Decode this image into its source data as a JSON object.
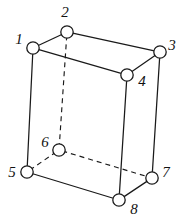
{
  "figure": {
    "type": "line-diagram",
    "background_color": "#ffffff",
    "stroke_color": "#1a1a1a",
    "label_color": "#111111",
    "canvas": {
      "width": 177,
      "height": 221
    },
    "vertex_radius": 6.2,
    "vertices": [
      {
        "id": "1",
        "label": "1",
        "x": 33,
        "y": 48,
        "hidden": false,
        "label_x": 19,
        "label_y": 44,
        "label_anchor": "middle"
      },
      {
        "id": "2",
        "label": "2",
        "x": 67,
        "y": 32,
        "hidden": false,
        "label_x": 65,
        "label_y": 17,
        "label_anchor": "middle"
      },
      {
        "id": "3",
        "label": "3",
        "x": 160,
        "y": 52,
        "hidden": false,
        "label_x": 172,
        "label_y": 50,
        "label_anchor": "middle"
      },
      {
        "id": "4",
        "label": "4",
        "x": 127,
        "y": 75,
        "hidden": false,
        "label_x": 142,
        "label_y": 86,
        "label_anchor": "middle"
      },
      {
        "id": "5",
        "label": "5",
        "x": 27,
        "y": 172,
        "hidden": false,
        "label_x": 12,
        "label_y": 177,
        "label_anchor": "middle"
      },
      {
        "id": "6",
        "label": "6",
        "x": 59,
        "y": 150,
        "hidden": true,
        "label_x": 45,
        "label_y": 147,
        "label_anchor": "middle"
      },
      {
        "id": "7",
        "label": "7",
        "x": 152,
        "y": 178,
        "hidden": false,
        "label_x": 166,
        "label_y": 177,
        "label_anchor": "middle"
      },
      {
        "id": "8",
        "label": "8",
        "x": 119,
        "y": 200,
        "hidden": false,
        "label_x": 134,
        "label_y": 214,
        "label_anchor": "middle"
      }
    ],
    "edges": [
      {
        "from": "1",
        "to": "2",
        "style": "solid",
        "name": "edge-1-2"
      },
      {
        "from": "2",
        "to": "3",
        "style": "solid",
        "name": "edge-2-3"
      },
      {
        "from": "3",
        "to": "4",
        "style": "solid",
        "name": "edge-3-4"
      },
      {
        "from": "4",
        "to": "1",
        "style": "solid",
        "name": "edge-4-1"
      },
      {
        "from": "1",
        "to": "5",
        "style": "solid",
        "name": "edge-1-5"
      },
      {
        "from": "3",
        "to": "7",
        "style": "solid",
        "name": "edge-3-7"
      },
      {
        "from": "4",
        "to": "8",
        "style": "solid",
        "name": "edge-4-8"
      },
      {
        "from": "5",
        "to": "8",
        "style": "solid",
        "name": "edge-5-8"
      },
      {
        "from": "8",
        "to": "7",
        "style": "solid",
        "name": "edge-8-7"
      },
      {
        "from": "2",
        "to": "6",
        "style": "dashed",
        "name": "edge-2-6-hidden"
      },
      {
        "from": "5",
        "to": "6",
        "style": "dashed",
        "name": "edge-5-6-hidden"
      },
      {
        "from": "6",
        "to": "7",
        "style": "dashed",
        "name": "edge-6-7-hidden"
      }
    ],
    "notes": {
      "hidden_vertex": "6",
      "hidden_edge_count": 3,
      "visible_edge_count": 9,
      "vertex_count": 8
    }
  }
}
